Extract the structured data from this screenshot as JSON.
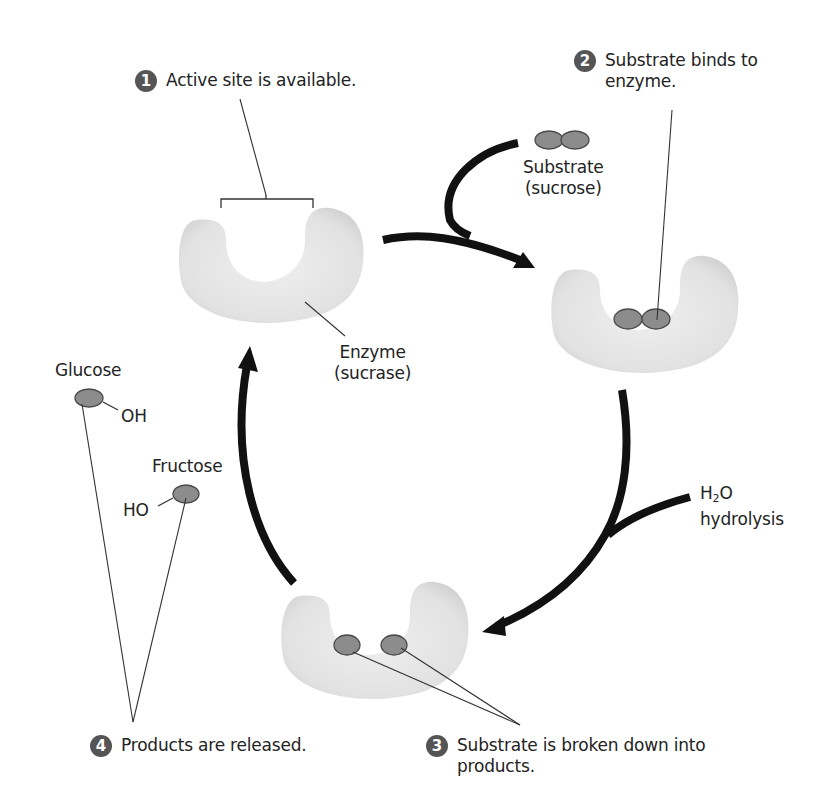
{
  "diagram": {
    "steps": [
      {
        "number": "1",
        "text": "Active site is available."
      },
      {
        "number": "2",
        "text_line1": "Substrate binds to",
        "text_line2": "enzyme."
      },
      {
        "number": "3",
        "text_line1": "Substrate is broken down into",
        "text_line2": "products."
      },
      {
        "number": "4",
        "text": "Products are released."
      }
    ],
    "labels": {
      "substrate_line1": "Substrate",
      "substrate_line2": "(sucrose)",
      "enzyme_line1": "Enzyme",
      "enzyme_line2": "(sucrase)",
      "water_h": "H",
      "water_sub": "2",
      "water_o": "O",
      "hydrolysis": "hydrolysis",
      "glucose": "Glucose",
      "glucose_group": "OH",
      "fructose": "Fructose",
      "fructose_group": "HO"
    },
    "colors": {
      "enzyme_fill": "#e4e4e4",
      "molecule_fill": "#8c8c8c",
      "molecule_stroke": "#4a4a4a",
      "arrow": "#111111",
      "badge": "#555555"
    }
  }
}
